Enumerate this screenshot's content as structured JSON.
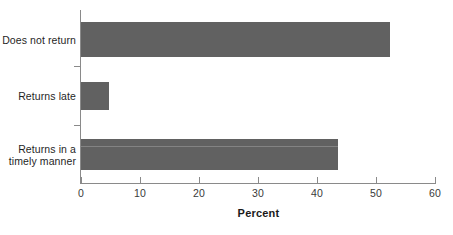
{
  "chart_data": {
    "type": "bar",
    "orientation": "horizontal",
    "title": "",
    "subtitle": "",
    "xlabel": "Percent",
    "ylabel": "",
    "categories": [
      "Does not return",
      "Returns late",
      "Returns in a\ntimely manner"
    ],
    "values": [
      52.4,
      4.7,
      43.6
    ],
    "series": [
      {
        "name": "Percent",
        "values": [
          52.4,
          4.7,
          43.6
        ]
      }
    ],
    "xlim": [
      0,
      60
    ],
    "xticks": [
      0,
      10,
      20,
      30,
      40,
      50,
      60
    ],
    "xtick_labels": [
      "0",
      "10",
      "20",
      "30",
      "40",
      "50",
      "60"
    ],
    "grid": false,
    "legend": false,
    "legend_position": "none",
    "bar_color": "#616161",
    "axis_color": "#8a8a8a",
    "text_color": "#1f1f1f",
    "background": "#ffffff"
  },
  "axis": {
    "x_title": "Percent"
  }
}
